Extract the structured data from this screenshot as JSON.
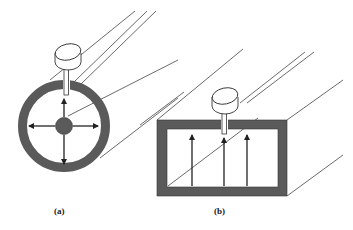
{
  "figure": {
    "panels": [
      {
        "id": "a",
        "label": "(a)",
        "description": "Coaxial waveguide cross-section with probe feed; radial field arrows"
      },
      {
        "id": "b",
        "label": "(b)",
        "description": "Rectangular waveguide cross-section with probe feed; vertical field arrows"
      }
    ],
    "colors": {
      "wall": "#5a5a5a",
      "line": "#333333",
      "background": "#ffffff"
    }
  }
}
